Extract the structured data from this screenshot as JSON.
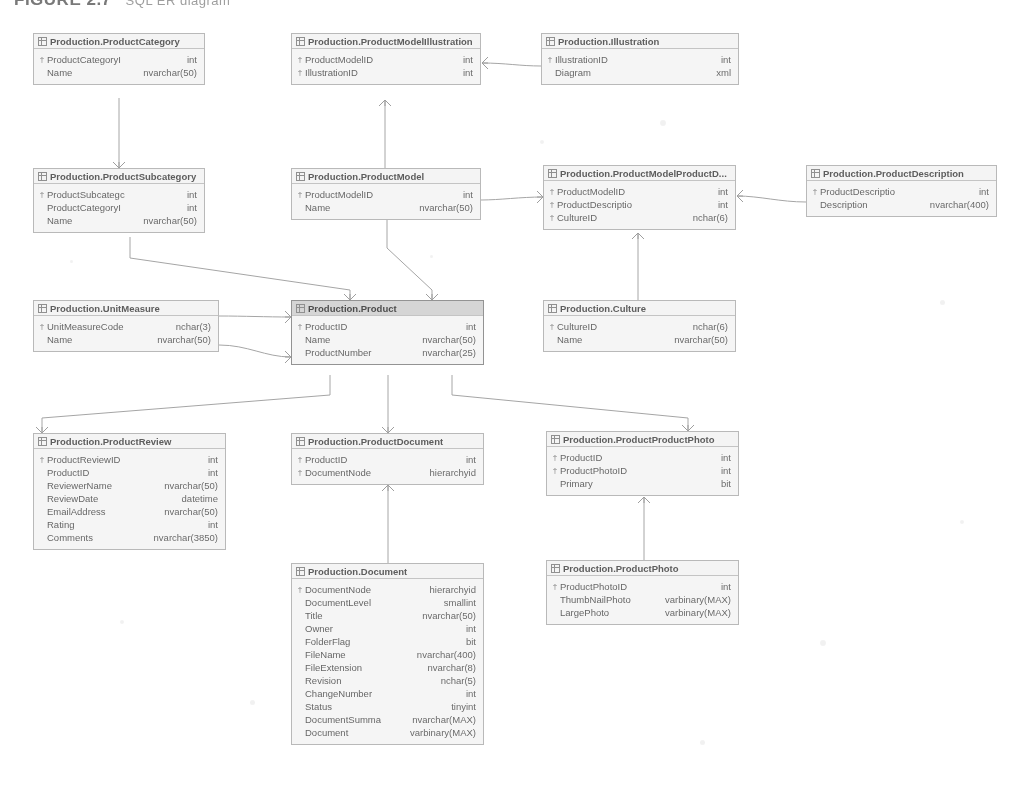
{
  "figure": {
    "title": "FIGURE 2.7",
    "subtitle": "SQL ER diagram"
  },
  "icons": {
    "table": "grid-icon",
    "primary_key": "†"
  },
  "tables": [
    {
      "id": "product-category",
      "name": "Production.ProductCategory",
      "selected": false,
      "x": 33,
      "y": 33,
      "w": 172,
      "columns": [
        {
          "key": true,
          "name": "ProductCategoryI",
          "type": "int"
        },
        {
          "key": false,
          "name": "Name",
          "type": "nvarchar(50)"
        }
      ]
    },
    {
      "id": "product-model-illustration",
      "name": "Production.ProductModelIllustration",
      "selected": false,
      "x": 291,
      "y": 33,
      "w": 190,
      "columns": [
        {
          "key": true,
          "name": "ProductModelID",
          "type": "int"
        },
        {
          "key": true,
          "name": "IllustrationID",
          "type": "int"
        }
      ]
    },
    {
      "id": "illustration",
      "name": "Production.Illustration",
      "selected": false,
      "x": 541,
      "y": 33,
      "w": 198,
      "columns": [
        {
          "key": true,
          "name": "IllustrationID",
          "type": "int"
        },
        {
          "key": false,
          "name": "Diagram",
          "type": "xml"
        }
      ]
    },
    {
      "id": "product-subcategory",
      "name": "Production.ProductSubcategory",
      "selected": false,
      "x": 33,
      "y": 168,
      "w": 172,
      "columns": [
        {
          "key": true,
          "name": "ProductSubcategc",
          "type": "int"
        },
        {
          "key": false,
          "name": "ProductCategoryI",
          "type": "int"
        },
        {
          "key": false,
          "name": "Name",
          "type": "nvarchar(50)"
        }
      ]
    },
    {
      "id": "product-model",
      "name": "Production.ProductModel",
      "selected": false,
      "x": 291,
      "y": 168,
      "w": 190,
      "columns": [
        {
          "key": true,
          "name": "ProductModelID",
          "type": "int"
        },
        {
          "key": false,
          "name": "Name",
          "type": "nvarchar(50)"
        }
      ]
    },
    {
      "id": "product-model-product-description",
      "name": "Production.ProductModelProductD...",
      "selected": false,
      "x": 543,
      "y": 165,
      "w": 193,
      "columns": [
        {
          "key": true,
          "name": "ProductModelID",
          "type": "int"
        },
        {
          "key": true,
          "name": "ProductDescriptio",
          "type": "int"
        },
        {
          "key": true,
          "name": "CultureID",
          "type": "nchar(6)"
        }
      ]
    },
    {
      "id": "product-description",
      "name": "Production.ProductDescription",
      "selected": false,
      "x": 806,
      "y": 165,
      "w": 191,
      "columns": [
        {
          "key": true,
          "name": "ProductDescriptio",
          "type": "int"
        },
        {
          "key": false,
          "name": "Description",
          "type": "nvarchar(400)"
        }
      ]
    },
    {
      "id": "unit-measure",
      "name": "Production.UnitMeasure",
      "selected": false,
      "x": 33,
      "y": 300,
      "w": 186,
      "columns": [
        {
          "key": true,
          "name": "UnitMeasureCode",
          "type": "nchar(3)"
        },
        {
          "key": false,
          "name": "Name",
          "type": "nvarchar(50)"
        }
      ]
    },
    {
      "id": "product",
      "name": "Production.Product",
      "selected": true,
      "x": 291,
      "y": 300,
      "w": 193,
      "columns": [
        {
          "key": true,
          "name": "ProductID",
          "type": "int"
        },
        {
          "key": false,
          "name": "Name",
          "type": "nvarchar(50)"
        },
        {
          "key": false,
          "name": "ProductNumber",
          "type": "nvarchar(25)"
        }
      ]
    },
    {
      "id": "culture",
      "name": "Production.Culture",
      "selected": false,
      "x": 543,
      "y": 300,
      "w": 193,
      "columns": [
        {
          "key": true,
          "name": "CultureID",
          "type": "nchar(6)"
        },
        {
          "key": false,
          "name": "Name",
          "type": "nvarchar(50)"
        }
      ]
    },
    {
      "id": "product-review",
      "name": "Production.ProductReview",
      "selected": false,
      "x": 33,
      "y": 433,
      "w": 193,
      "columns": [
        {
          "key": true,
          "name": "ProductReviewID",
          "type": "int"
        },
        {
          "key": false,
          "name": "ProductID",
          "type": "int"
        },
        {
          "key": false,
          "name": "ReviewerName",
          "type": "nvarchar(50)"
        },
        {
          "key": false,
          "name": "ReviewDate",
          "type": "datetime"
        },
        {
          "key": false,
          "name": "EmailAddress",
          "type": "nvarchar(50)"
        },
        {
          "key": false,
          "name": "Rating",
          "type": "int"
        },
        {
          "key": false,
          "name": "Comments",
          "type": "nvarchar(3850)"
        }
      ]
    },
    {
      "id": "product-document",
      "name": "Production.ProductDocument",
      "selected": false,
      "x": 291,
      "y": 433,
      "w": 193,
      "columns": [
        {
          "key": true,
          "name": "ProductID",
          "type": "int"
        },
        {
          "key": true,
          "name": "DocumentNode",
          "type": "hierarchyid"
        }
      ]
    },
    {
      "id": "product-product-photo",
      "name": "Production.ProductProductPhoto",
      "selected": false,
      "x": 546,
      "y": 431,
      "w": 193,
      "columns": [
        {
          "key": true,
          "name": "ProductID",
          "type": "int"
        },
        {
          "key": true,
          "name": "ProductPhotoID",
          "type": "int"
        },
        {
          "key": false,
          "name": "Primary",
          "type": "bit"
        }
      ]
    },
    {
      "id": "document",
      "name": "Production.Document",
      "selected": false,
      "x": 291,
      "y": 563,
      "w": 193,
      "columns": [
        {
          "key": true,
          "name": "DocumentNode",
          "type": "hierarchyid"
        },
        {
          "key": false,
          "name": "DocumentLevel",
          "type": "smallint"
        },
        {
          "key": false,
          "name": "Title",
          "type": "nvarchar(50)"
        },
        {
          "key": false,
          "name": "Owner",
          "type": "int"
        },
        {
          "key": false,
          "name": "FolderFlag",
          "type": "bit"
        },
        {
          "key": false,
          "name": "FileName",
          "type": "nvarchar(400)"
        },
        {
          "key": false,
          "name": "FileExtension",
          "type": "nvarchar(8)"
        },
        {
          "key": false,
          "name": "Revision",
          "type": "nchar(5)"
        },
        {
          "key": false,
          "name": "ChangeNumber",
          "type": "int"
        },
        {
          "key": false,
          "name": "Status",
          "type": "tinyint"
        },
        {
          "key": false,
          "name": "DocumentSumma",
          "type": "nvarchar(MAX)"
        },
        {
          "key": false,
          "name": "Document",
          "type": "varbinary(MAX)"
        }
      ]
    },
    {
      "id": "product-photo",
      "name": "Production.ProductPhoto",
      "selected": false,
      "x": 546,
      "y": 560,
      "w": 193,
      "columns": [
        {
          "key": true,
          "name": "ProductPhotoID",
          "type": "int"
        },
        {
          "key": false,
          "name": "ThumbNailPhoto",
          "type": "varbinary(MAX)"
        },
        {
          "key": false,
          "name": "LargePhoto",
          "type": "varbinary(MAX)"
        }
      ]
    }
  ],
  "relationships": [
    {
      "id": "rel-category-subcategory",
      "from": "product-category",
      "to": "product-subcategory"
    },
    {
      "id": "rel-illustration-pmi",
      "from": "illustration",
      "to": "product-model-illustration"
    },
    {
      "id": "rel-productmodel-pmi",
      "from": "product-model",
      "to": "product-model-illustration"
    },
    {
      "id": "rel-description-pmpd",
      "from": "product-description",
      "to": "product-model-product-description"
    },
    {
      "id": "rel-culture-pmpd",
      "from": "culture",
      "to": "product-model-product-description"
    },
    {
      "id": "rel-productmodel-pmpd",
      "from": "product-model",
      "to": "product-model-product-description"
    },
    {
      "id": "rel-subcategory-product",
      "from": "product-subcategory",
      "to": "product"
    },
    {
      "id": "rel-unitmeasure-product-a",
      "from": "unit-measure",
      "to": "product"
    },
    {
      "id": "rel-unitmeasure-product-b",
      "from": "unit-measure",
      "to": "product"
    },
    {
      "id": "rel-productmodel-product",
      "from": "product-model",
      "to": "product"
    },
    {
      "id": "rel-product-review",
      "from": "product",
      "to": "product-review"
    },
    {
      "id": "rel-product-document",
      "from": "product",
      "to": "product-document"
    },
    {
      "id": "rel-product-productphoto",
      "from": "product",
      "to": "product-product-photo"
    },
    {
      "id": "rel-productdocument-document",
      "from": "product-document",
      "to": "document"
    },
    {
      "id": "rel-productproductphoto-photo",
      "from": "product-product-photo",
      "to": "product-photo"
    }
  ],
  "colors": {
    "border": "#b9b9b9",
    "text": "#5a5a5a",
    "line": "#a2a2a2",
    "selected_header": "#d9d9d9",
    "background": "#ffffff"
  }
}
